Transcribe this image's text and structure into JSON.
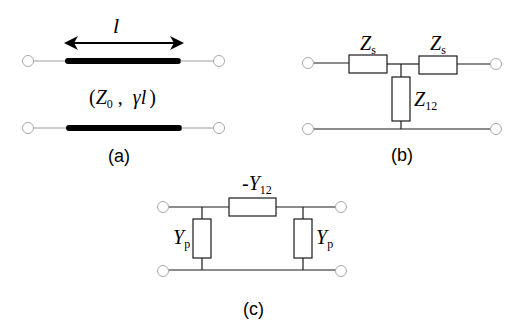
{
  "figure": {
    "panels": [
      {
        "id": "a",
        "caption": "(a)",
        "title": "Transmission line segment",
        "length_symbol": "l",
        "params_open": "(",
        "param1_main": "Z",
        "param1_sub": "0",
        "param_sep": " ,  ",
        "param2": "γl",
        "params_close": ")"
      },
      {
        "id": "b",
        "caption": "(b)",
        "title": "T-equivalent network",
        "series_left": {
          "main": "Z",
          "sub": "s"
        },
        "series_right": {
          "main": "Z",
          "sub": "s"
        },
        "shunt": {
          "main": "Z",
          "sub": "12"
        }
      },
      {
        "id": "c",
        "caption": "(c)",
        "title": "Pi-equivalent network",
        "series": {
          "prefix": "-",
          "main": "Y",
          "sub": "12"
        },
        "shunt_left": {
          "main": "Y",
          "sub": "p"
        },
        "shunt_right": {
          "main": "Y",
          "sub": "p"
        }
      }
    ],
    "colors": {
      "wire": "#1a1a1a",
      "thin_wire": "#9a9a9a",
      "terminal": "#a8a8a8",
      "thick_line": "#000000"
    }
  }
}
